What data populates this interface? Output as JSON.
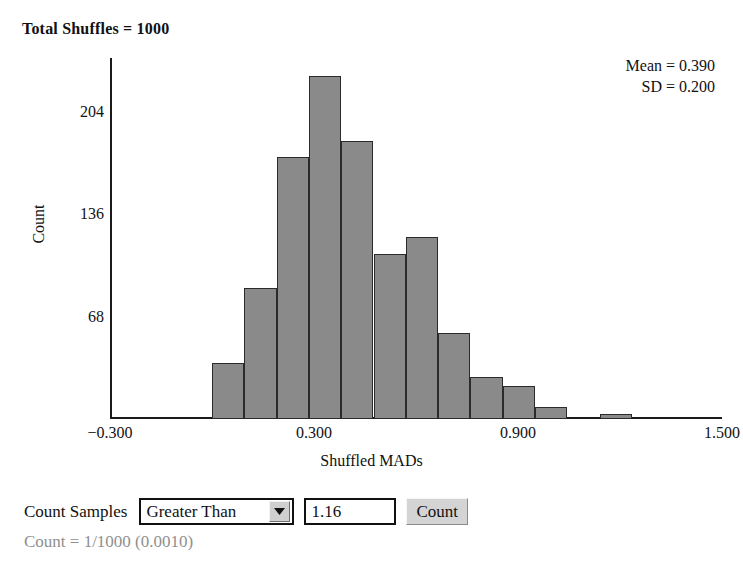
{
  "title": "Total Shuffles = 1000",
  "stats": {
    "mean_line": "Mean = 0.390",
    "sd_line": "SD = 0.200"
  },
  "chart_data": {
    "type": "bar",
    "title": "Total Shuffles = 1000",
    "xlabel": "Shuffled MADs",
    "ylabel": "Count",
    "xlim": [
      -0.3,
      1.5
    ],
    "ylim": [
      0,
      240
    ],
    "grid": false,
    "bin_width": 0.095,
    "x_ticks": [
      "−0.300",
      "0.300",
      "0.900",
      "1.500"
    ],
    "x_tick_values": [
      -0.3,
      0.3,
      0.9,
      1.5
    ],
    "y_ticks": [
      "68",
      "136",
      "204"
    ],
    "y_tick_values": [
      68,
      136,
      204
    ],
    "categories": [
      "0.000",
      "0.095",
      "0.190",
      "0.285",
      "0.380",
      "0.475",
      "0.570",
      "0.665",
      "0.760",
      "0.855",
      "0.950",
      "1.045",
      "1.140"
    ],
    "bin_starts": [
      0.0,
      0.095,
      0.19,
      0.285,
      0.38,
      0.475,
      0.57,
      0.665,
      0.76,
      0.855,
      0.95,
      1.045,
      1.14
    ],
    "values": [
      37,
      87,
      174,
      228,
      185,
      110,
      121,
      57,
      28,
      22,
      8,
      0,
      1
    ],
    "legend": [],
    "annotations": [
      "Mean = 0.390",
      "SD = 0.200"
    ]
  },
  "controls": {
    "label": "Count Samples",
    "comparison": {
      "selected": "Greater Than",
      "arrow_icon": "chevron-down-icon"
    },
    "threshold_value": "1.16",
    "count_button": "Count"
  },
  "result_text": "Count = 1/1000 (0.0010)",
  "colors": {
    "bar_fill": "#8a8a8a",
    "bar_border": "#2b2b2b",
    "axis": "#1a1a1a",
    "result_text": "#8f8f8f"
  }
}
